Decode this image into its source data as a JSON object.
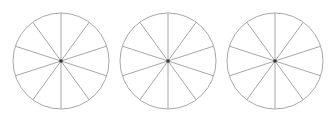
{
  "diagram": {
    "colors": {
      "background": "#ffffff",
      "outline": "#a8a8a8",
      "spoke": "#a8a8a8",
      "center_dot": "#333333"
    },
    "stroke_width": 1,
    "radius": 48,
    "sectors_per_circle": 10,
    "spoke_start_angle_deg": -90,
    "circles": [
      {
        "id": "circle-1",
        "cx": 61,
        "cy": 61
      },
      {
        "id": "circle-2",
        "cx": 168,
        "cy": 61
      },
      {
        "id": "circle-3",
        "cx": 275,
        "cy": 61
      }
    ]
  }
}
